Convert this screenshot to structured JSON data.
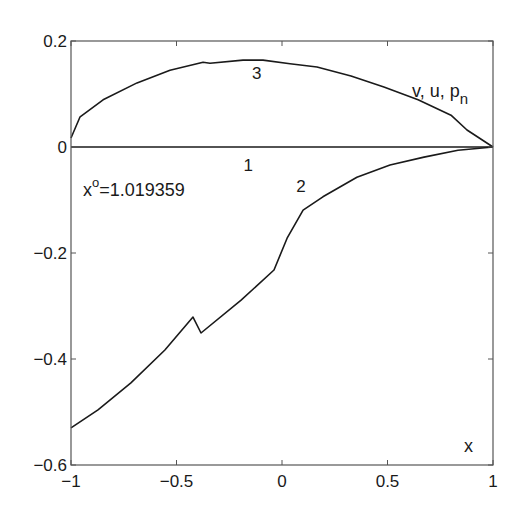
{
  "chart_data": {
    "type": "line",
    "title": "",
    "xlabel": "x",
    "ylabel": "v, u, p_n",
    "ylabel_parts": {
      "main": "v, u, p",
      "sub": "n"
    },
    "xlim": [
      -1,
      1
    ],
    "ylim": [
      -0.6,
      0.2
    ],
    "grid": false,
    "legend": "none (curves labeled inline 1, 2, 3)",
    "x_ticks": [
      -1,
      -0.5,
      0,
      0.5,
      1
    ],
    "x_tick_labels": [
      "−1",
      "−0.5",
      "0",
      "0.5",
      "1"
    ],
    "y_ticks": [
      -0.6,
      -0.4,
      -0.2,
      0,
      0.2
    ],
    "y_tick_labels": [
      "−0.6",
      "−0.4",
      "−0.2",
      "0",
      "0.2"
    ],
    "annotations": [
      {
        "text_main": "x",
        "text_sup": "o",
        "text_rest": "=1.019359",
        "x": -0.94,
        "y": -0.09
      }
    ],
    "series": [
      {
        "name": "1",
        "label": "1",
        "label_pos": [
          -0.16,
          -0.045
        ],
        "x": [
          -1,
          1
        ],
        "y": [
          0,
          0
        ]
      },
      {
        "name": "2",
        "label": "2",
        "label_pos": [
          0.09,
          -0.085
        ],
        "x": [
          -1,
          -0.872,
          -0.716,
          -0.555,
          -0.422,
          -0.384,
          -0.194,
          -0.038,
          0.024,
          0.1,
          0.194,
          0.355,
          0.512,
          0.673,
          0.834,
          1
        ],
        "y": [
          -0.53,
          -0.496,
          -0.445,
          -0.383,
          -0.321,
          -0.351,
          -0.289,
          -0.232,
          -0.172,
          -0.119,
          -0.094,
          -0.057,
          -0.034,
          -0.019,
          -0.006,
          0
        ]
      },
      {
        "name": "3",
        "label": "3",
        "label_pos": [
          -0.12,
          0.128
        ],
        "x": [
          -1,
          -0.957,
          -0.848,
          -0.687,
          -0.531,
          -0.374,
          -0.341,
          -0.185,
          -0.09,
          0.038,
          0.166,
          0.327,
          0.483,
          0.645,
          0.801,
          0.877,
          1
        ],
        "y": [
          0.017,
          0.057,
          0.089,
          0.121,
          0.145,
          0.16,
          0.158,
          0.164,
          0.164,
          0.157,
          0.151,
          0.134,
          0.113,
          0.089,
          0.06,
          0.032,
          0
        ]
      }
    ]
  },
  "colors": {
    "axis": "#333333",
    "curve": "#1a1a1a",
    "background": "#ffffff"
  }
}
